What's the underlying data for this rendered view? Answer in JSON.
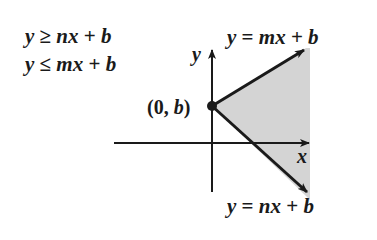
{
  "system": {
    "ineq1": {
      "lhs": "y",
      "op": "≥",
      "rhs_var": "nx",
      "plus": "+",
      "const": "b"
    },
    "ineq2": {
      "lhs": "y",
      "op": "≤",
      "rhs_var": "mx",
      "plus": "+",
      "const": "b"
    }
  },
  "graph": {
    "y_axis_label": "y",
    "x_axis_label": "x",
    "point_label": {
      "open": "(",
      "x": "0",
      "comma": ",",
      "y": "b",
      "close": ")"
    },
    "upper_line": {
      "lhs": "y",
      "eq": "=",
      "var": "mx",
      "plus": "+",
      "const": "b"
    },
    "lower_line": {
      "lhs": "y",
      "eq": "=",
      "var": "nx",
      "plus": "+",
      "const": "b"
    },
    "colors": {
      "ink": "#1a1a1a",
      "shade": "#d4d4d4"
    }
  }
}
